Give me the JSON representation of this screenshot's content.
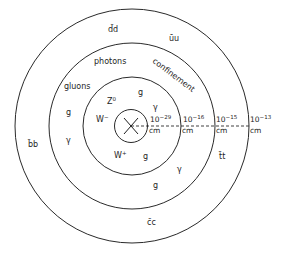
{
  "diagram": {
    "rings": [
      {
        "name": "innermost",
        "scale_label": {
          "base": "10",
          "exponent": "−29",
          "unit": "cm"
        }
      },
      {
        "name": "electroweak",
        "scale_label": {
          "base": "10",
          "exponent": "−16",
          "unit": "cm"
        }
      },
      {
        "name": "confinement",
        "scale_label": {
          "base": "10",
          "exponent": "−15",
          "unit": "cm"
        }
      },
      {
        "name": "outer",
        "scale_label": {
          "base": "10",
          "exponent": "−13",
          "unit": "cm"
        }
      }
    ],
    "labels": {
      "dd": "d̄d",
      "uu": "ūu",
      "bb": "b̄b",
      "tt": "t̄t",
      "cc": "c̄c",
      "photons": "photons",
      "gluons": "gluons",
      "confinement": "confinement",
      "g_left": "g",
      "gamma_left": "γ",
      "z0": "Z",
      "z0_sup": "0",
      "w_minus": "W",
      "w_minus_sup": "−",
      "w_plus": "W",
      "w_plus_sup": "+",
      "g_inner_top": "g",
      "gamma_inner_top": "γ",
      "g_inner_bottom": "g",
      "gamma_mid_bottom": "γ",
      "g_mid_bottom": "g"
    }
  }
}
